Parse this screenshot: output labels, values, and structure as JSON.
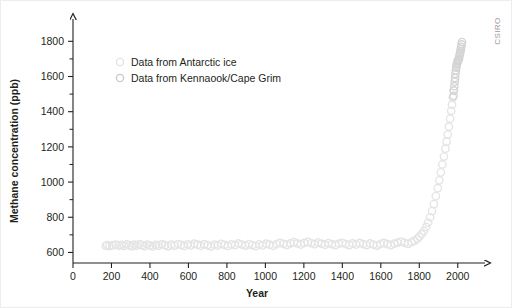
{
  "brand": {
    "label": "CSIRO"
  },
  "chart_data": {
    "type": "scatter",
    "title": "",
    "xlabel": "Year",
    "ylabel": "Methane concentration (ppb)",
    "xlim": [
      0,
      2100
    ],
    "ylim": [
      540,
      1870
    ],
    "xticks": [
      0,
      200,
      400,
      600,
      800,
      1000,
      1200,
      1400,
      1600,
      1800,
      2000
    ],
    "yticks": [
      600,
      800,
      1000,
      1200,
      1400,
      1600,
      1800
    ],
    "yticks_minor": [
      700,
      900,
      1100,
      1300,
      1500,
      1700
    ],
    "grid": false,
    "legend_position": "upper-left",
    "series": [
      {
        "name": "Data from Antarctic ice",
        "marker": "open-circle",
        "color": "#e4e4e4",
        "points": [
          [
            170,
            638
          ],
          [
            178,
            642
          ],
          [
            190,
            636
          ],
          [
            205,
            640
          ],
          [
            222,
            645
          ],
          [
            238,
            639
          ],
          [
            252,
            643
          ],
          [
            266,
            637
          ],
          [
            278,
            646
          ],
          [
            292,
            641
          ],
          [
            305,
            634
          ],
          [
            318,
            644
          ],
          [
            332,
            639
          ],
          [
            346,
            648
          ],
          [
            358,
            642
          ],
          [
            372,
            636
          ],
          [
            386,
            645
          ],
          [
            400,
            640
          ],
          [
            415,
            634
          ],
          [
            430,
            643
          ],
          [
            445,
            638
          ],
          [
            462,
            647
          ],
          [
            478,
            641
          ],
          [
            494,
            635
          ],
          [
            510,
            644
          ],
          [
            528,
            639
          ],
          [
            545,
            648
          ],
          [
            562,
            643
          ],
          [
            578,
            637
          ],
          [
            596,
            646
          ],
          [
            612,
            640
          ],
          [
            630,
            650
          ],
          [
            648,
            644
          ],
          [
            664,
            638
          ],
          [
            682,
            647
          ],
          [
            700,
            641
          ],
          [
            718,
            635
          ],
          [
            735,
            645
          ],
          [
            752,
            640
          ],
          [
            770,
            649
          ],
          [
            788,
            643
          ],
          [
            806,
            637
          ],
          [
            824,
            646
          ],
          [
            842,
            641
          ],
          [
            860,
            651
          ],
          [
            878,
            645
          ],
          [
            896,
            639
          ],
          [
            914,
            648
          ],
          [
            932,
            642
          ],
          [
            950,
            636
          ],
          [
            968,
            646
          ],
          [
            986,
            640
          ],
          [
            1004,
            650
          ],
          [
            1022,
            644
          ],
          [
            1040,
            638
          ],
          [
            1058,
            648
          ],
          [
            1076,
            655
          ],
          [
            1094,
            649
          ],
          [
            1112,
            643
          ],
          [
            1130,
            652
          ],
          [
            1148,
            658
          ],
          [
            1166,
            651
          ],
          [
            1184,
            645
          ],
          [
            1202,
            654
          ],
          [
            1220,
            660
          ],
          [
            1238,
            653
          ],
          [
            1256,
            647
          ],
          [
            1274,
            656
          ],
          [
            1292,
            650
          ],
          [
            1310,
            644
          ],
          [
            1328,
            653
          ],
          [
            1346,
            647
          ],
          [
            1364,
            641
          ],
          [
            1382,
            650
          ],
          [
            1400,
            655
          ],
          [
            1418,
            648
          ],
          [
            1436,
            642
          ],
          [
            1454,
            651
          ],
          [
            1472,
            645
          ],
          [
            1490,
            654
          ],
          [
            1508,
            648
          ],
          [
            1526,
            642
          ],
          [
            1544,
            651
          ],
          [
            1562,
            645
          ],
          [
            1580,
            639
          ],
          [
            1598,
            648
          ],
          [
            1616,
            654
          ],
          [
            1634,
            647
          ],
          [
            1652,
            641
          ],
          [
            1670,
            650
          ],
          [
            1688,
            656
          ],
          [
            1706,
            662
          ],
          [
            1724,
            655
          ],
          [
            1742,
            649
          ],
          [
            1760,
            658
          ],
          [
            1775,
            666
          ],
          [
            1790,
            678
          ],
          [
            1800,
            690
          ],
          [
            1812,
            704
          ],
          [
            1824,
            722
          ],
          [
            1836,
            745
          ],
          [
            1846,
            770
          ],
          [
            1856,
            800
          ],
          [
            1866,
            835
          ],
          [
            1876,
            875
          ],
          [
            1886,
            920
          ],
          [
            1896,
            965
          ],
          [
            1904,
            1010
          ],
          [
            1912,
            1055
          ],
          [
            1920,
            1100
          ],
          [
            1928,
            1145
          ],
          [
            1936,
            1190
          ],
          [
            1942,
            1230
          ],
          [
            1948,
            1270
          ],
          [
            1954,
            1315
          ],
          [
            1960,
            1360
          ],
          [
            1966,
            1405
          ],
          [
            1970,
            1440
          ],
          [
            1974,
            1480
          ],
          [
            1978,
            1520
          ]
        ]
      },
      {
        "name": "Data from Kennaook/Cape Grim",
        "marker": "open-circle",
        "color": "#d4d4d4",
        "points": [
          [
            1978,
            1490
          ],
          [
            1980,
            1520
          ],
          [
            1982,
            1545
          ],
          [
            1984,
            1570
          ],
          [
            1986,
            1592
          ],
          [
            1988,
            1615
          ],
          [
            1990,
            1635
          ],
          [
            1992,
            1650
          ],
          [
            1994,
            1662
          ],
          [
            1996,
            1672
          ],
          [
            1998,
            1680
          ],
          [
            2000,
            1688
          ],
          [
            2002,
            1692
          ],
          [
            2004,
            1696
          ],
          [
            2006,
            1700
          ],
          [
            2008,
            1712
          ],
          [
            2010,
            1724
          ],
          [
            2012,
            1734
          ],
          [
            2014,
            1744
          ],
          [
            2016,
            1756
          ],
          [
            2018,
            1768
          ],
          [
            2020,
            1782
          ],
          [
            2022,
            1796
          ]
        ]
      }
    ]
  }
}
